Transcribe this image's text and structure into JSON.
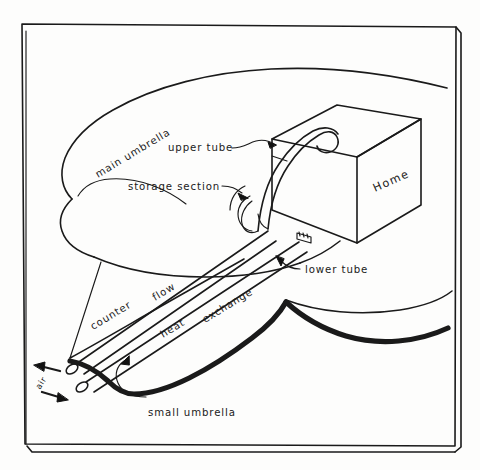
{
  "figure": {
    "background_color": "#fdfdfc",
    "ink_color": "#1a1a1a",
    "frame": {
      "name": "picture-frame",
      "style": "double-line rectangular border with offset 3D right and bottom edge"
    }
  },
  "labels": {
    "main_umbrella": "main umbrella",
    "upper_tube": "upper tube",
    "storage_section": "storage section",
    "home": "Home",
    "lower_tube": "lower tube",
    "counter": "counter",
    "flow": "flow",
    "heat": "heat",
    "exchange": "exchange",
    "small_umbrella": "small umbrella",
    "air": "air"
  },
  "components": [
    {
      "name": "main-umbrella",
      "label": "main umbrella",
      "description": "large rounded canopy slab at upper left with visible thickness edge"
    },
    {
      "name": "storage-section",
      "label": "storage section",
      "description": "thermal storage region beneath the main umbrella near the house"
    },
    {
      "name": "upper-tube",
      "label": "upper tube",
      "description": "tube rising over the top edge of the house and hooking down"
    },
    {
      "name": "lower-tube",
      "label": "lower tube",
      "description": "tube entering the base of the house through a small fitting"
    },
    {
      "name": "counter-flow-heat-exchange",
      "label": "counter flow heat exchange",
      "description": "paired parallel tube bundle running down to the left"
    },
    {
      "name": "small-umbrella",
      "label": "small umbrella",
      "description": "heavy black curved band at lower left beneath the tube bundle"
    },
    {
      "name": "home",
      "label": "Home",
      "description": "isometric rectangular box representing the dwelling"
    },
    {
      "name": "air-ports",
      "label": "air",
      "description": "two open tube ends with in and out arrows at lower left"
    }
  ],
  "arrows": [
    {
      "name": "air-arrow-out",
      "direction": "left",
      "meaning": "air leaving"
    },
    {
      "name": "air-arrow-in",
      "direction": "right",
      "meaning": "air entering"
    }
  ]
}
